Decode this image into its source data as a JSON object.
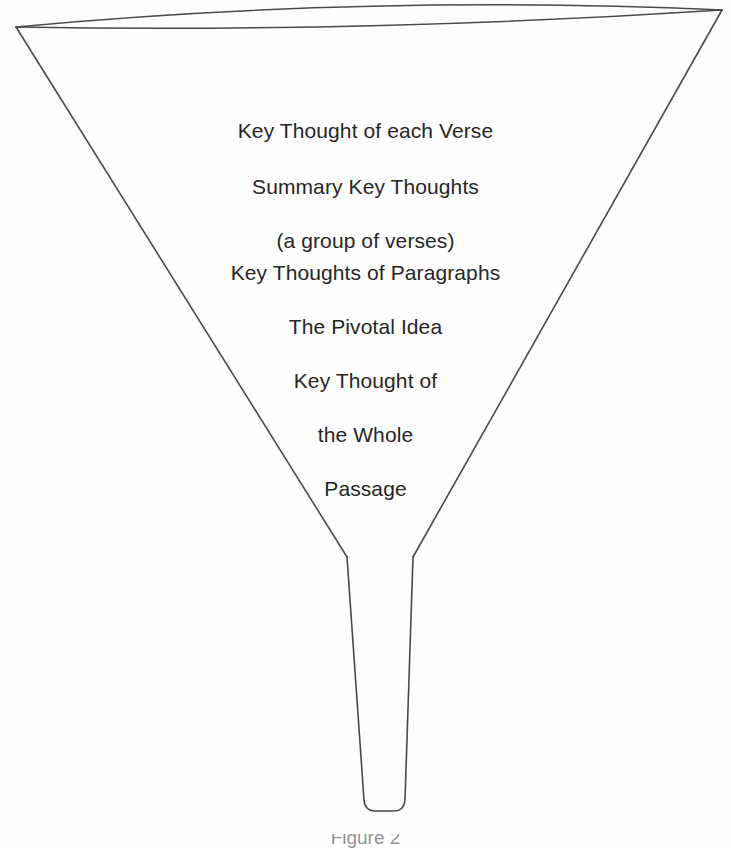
{
  "figure": {
    "type": "funnel-diagram",
    "background_color": "#fefefe",
    "line_color": "#4a4a4a",
    "text_color": "#262626"
  },
  "labels": {
    "verse": "Key Thought of each Verse",
    "summary_line1": "Summary Key Thoughts",
    "summary_line2": "(a group of verses)",
    "paragraphs": "Key Thoughts of Paragraphs",
    "pivotal": "The Pivotal Idea",
    "whole_line1": "Key Thought of",
    "whole_line2": "the Whole",
    "whole_line3": "Passage"
  },
  "caption": {
    "partial_text": "Figure 2"
  },
  "geometry": {
    "rim_left_tip": [
      16,
      27
    ],
    "rim_right_tip": [
      722,
      10
    ],
    "rim_front_sag": 30,
    "rim_back_sag": 3,
    "stem_joint_left": [
      347,
      557
    ],
    "stem_joint_right": [
      413,
      557
    ],
    "stem_bottom_left": [
      364,
      810
    ],
    "stem_bottom_right": [
      404,
      810
    ],
    "stem_bottom_corner_radius": 10
  }
}
